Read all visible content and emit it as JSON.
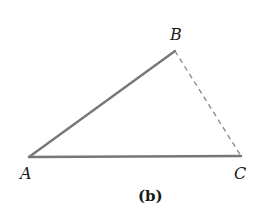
{
  "figure": {
    "caption": "(b)",
    "points": {
      "A": {
        "label": "A",
        "x": 29,
        "y": 157
      },
      "B": {
        "label": "B",
        "x": 175,
        "y": 51
      },
      "C": {
        "label": "C",
        "x": 241,
        "y": 156
      }
    },
    "segments": [
      {
        "from": "A",
        "to": "B",
        "style": "solid"
      },
      {
        "from": "A",
        "to": "C",
        "style": "solid"
      },
      {
        "from": "B",
        "to": "C",
        "style": "dashed"
      }
    ],
    "colors": {
      "solid_line": "#777777",
      "dashed_line": "#888888",
      "text": "#1a1a1a"
    }
  }
}
